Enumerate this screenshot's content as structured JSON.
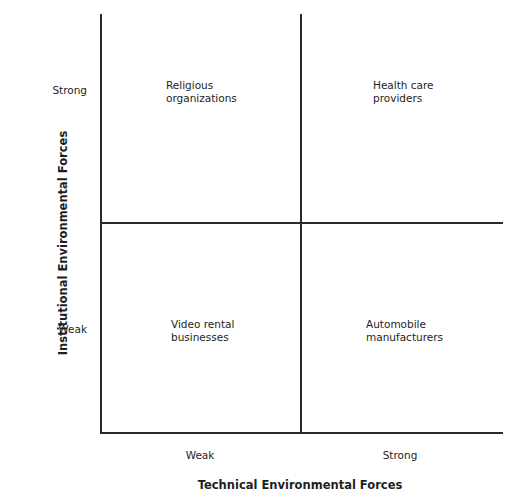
{
  "diagram": {
    "type": "2x2 matrix",
    "y_axis": {
      "title": "Institutional Environmental Forces",
      "ticks": [
        "Strong",
        "Weak"
      ]
    },
    "x_axis": {
      "title": "Technical Environmental Forces",
      "ticks": [
        "Weak",
        "Strong"
      ]
    },
    "quadrants": {
      "top_left": [
        "Religious",
        "organizations"
      ],
      "top_right": [
        "Health care",
        "providers"
      ],
      "bottom_left": [
        "Video rental",
        "businesses"
      ],
      "bottom_right": [
        "Automobile",
        "manufacturers"
      ]
    }
  }
}
